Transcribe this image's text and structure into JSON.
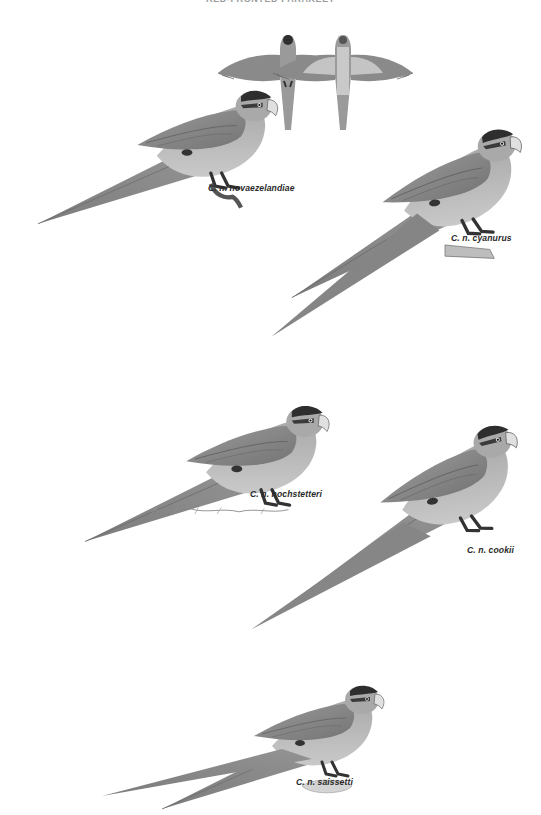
{
  "header": {
    "title": "RED-FRONTED PARAKEET"
  },
  "plate": {
    "colors": {
      "background": "#ffffff",
      "body_light": "#bcbcbc",
      "body_mid": "#a6a6a6",
      "wing": "#8e8e8e",
      "wing_dark": "#6f6f6f",
      "tail": "#8a8a8a",
      "cap": "#2e2e2e",
      "beak": "#e0e0e0",
      "label_text": "#2a2a2a"
    },
    "flight_figures": [
      {
        "name": "upperside",
        "view": "dorsal"
      },
      {
        "name": "underside",
        "view": "ventral"
      }
    ],
    "birds": [
      {
        "label": "C. n. novaezelandiae"
      },
      {
        "label": "C. n. cyanurus"
      },
      {
        "label": "C. n. hochstetteri"
      },
      {
        "label": "C. n. cookii"
      },
      {
        "label": "C. n. saissetti"
      }
    ]
  }
}
